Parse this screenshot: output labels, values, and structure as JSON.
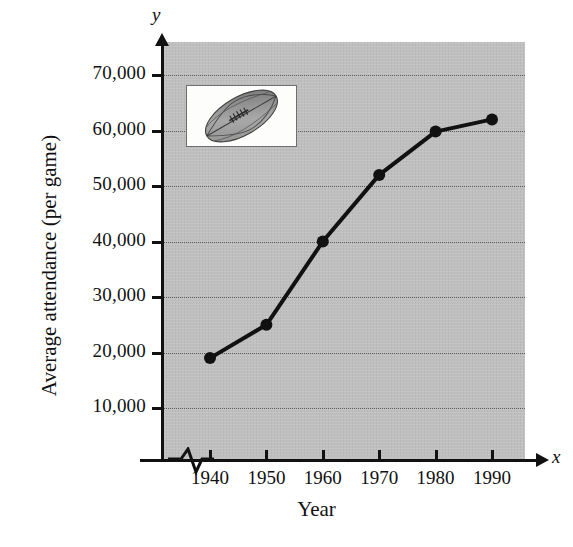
{
  "figure": {
    "axis_letters": {
      "y": "y",
      "x": "x"
    },
    "x_axis_title": "Year",
    "y_axis_title": "Average attendance (per game)",
    "inset_icon": "football-icon",
    "panel_color": "#bfbfbf",
    "series_color": "#111111",
    "gridline_color": "#5a5a5a"
  },
  "chart_data": {
    "type": "line",
    "title": "",
    "subtitle": "",
    "xlabel": "Year",
    "ylabel": "Average attendance (per game)",
    "x": [
      1940,
      1950,
      1960,
      1970,
      1980,
      1990
    ],
    "values": [
      19000,
      25000,
      40000,
      52000,
      59800,
      62000
    ],
    "series": [
      {
        "name": "Average attendance (per game)",
        "values": [
          19000,
          25000,
          40000,
          52000,
          59800,
          62000
        ]
      }
    ],
    "xtick_labels": [
      "1940",
      "1950",
      "1960",
      "1970",
      "1980",
      "1990"
    ],
    "ytick_values": [
      10000,
      20000,
      30000,
      40000,
      50000,
      60000,
      70000
    ],
    "ytick_labels": [
      "10,000",
      "20,000",
      "30,000",
      "40,000",
      "50,000",
      "60,000",
      "70,000"
    ],
    "xlim": [
      1933,
      1998
    ],
    "ylim": [
      0,
      75000
    ],
    "grid": true,
    "grid_axis": "y",
    "legend": false,
    "legend_position": "none",
    "markers": "filled-circle",
    "axis_break_x": true,
    "annotations": []
  }
}
